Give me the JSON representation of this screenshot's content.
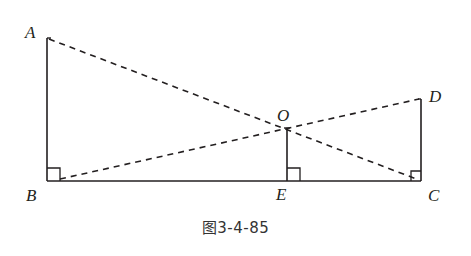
{
  "figure": {
    "caption": "图3-4-85",
    "colors": {
      "stroke": "#231f20",
      "background": "#ffffff"
    },
    "points": {
      "A": {
        "label": "A",
        "x": 47,
        "y": 38
      },
      "B": {
        "label": "B",
        "x": 47,
        "y": 181
      },
      "C": {
        "label": "C",
        "x": 421,
        "y": 181
      },
      "D": {
        "label": "D",
        "x": 421,
        "y": 99
      },
      "E": {
        "label": "E",
        "x": 287,
        "y": 181
      },
      "O": {
        "label": "O",
        "x": 287,
        "y": 128
      }
    },
    "segments": {
      "solid": [
        "AB",
        "BC",
        "OE",
        "DC"
      ],
      "dashed": [
        "AC",
        "BD"
      ]
    },
    "right_angles": [
      "B",
      "E",
      "C"
    ]
  }
}
